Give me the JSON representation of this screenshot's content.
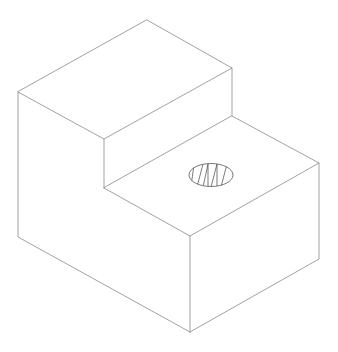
{
  "diagram": {
    "title": "",
    "colors": {
      "background": "#ffffff",
      "edge": "#8a8a8a",
      "hole_outline": "#555555",
      "hatch": "#444444"
    },
    "features": [
      {
        "name": "upper-step-block",
        "description": "raised rear block"
      },
      {
        "name": "lower-step-block",
        "description": "lower front block"
      },
      {
        "name": "hole",
        "description": "circular hole on lower top face, shown hatched"
      }
    ]
  }
}
